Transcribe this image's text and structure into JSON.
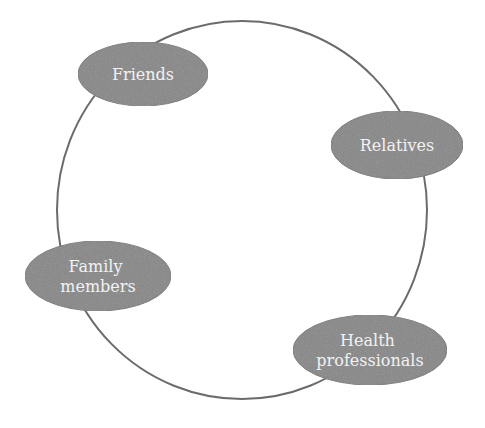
{
  "diagram": {
    "type": "cycle",
    "colors": {
      "background": "#ffffff",
      "ring_stroke": "#6b6b6b",
      "node_fill": "#878787",
      "node_fill_dark": "#7a7a7a",
      "node_text": "#f2f2f2"
    },
    "ring": {
      "cx": 242,
      "cy": 210,
      "rx": 185,
      "ry": 189
    },
    "nodes": [
      {
        "id": "friends",
        "label_lines": [
          "Friends"
        ],
        "cx": 143,
        "cy": 74,
        "rx": 65,
        "ry": 32
      },
      {
        "id": "relatives",
        "label_lines": [
          "Relatives"
        ],
        "cx": 397,
        "cy": 145,
        "rx": 66,
        "ry": 34
      },
      {
        "id": "family-members",
        "label_lines": [
          "Family",
          "members"
        ],
        "cx": 98,
        "cy": 276,
        "rx": 73,
        "ry": 35
      },
      {
        "id": "health-professionals",
        "label_lines": [
          "Health",
          "professionals"
        ],
        "cx": 370,
        "cy": 350,
        "rx": 77,
        "ry": 35
      }
    ]
  }
}
